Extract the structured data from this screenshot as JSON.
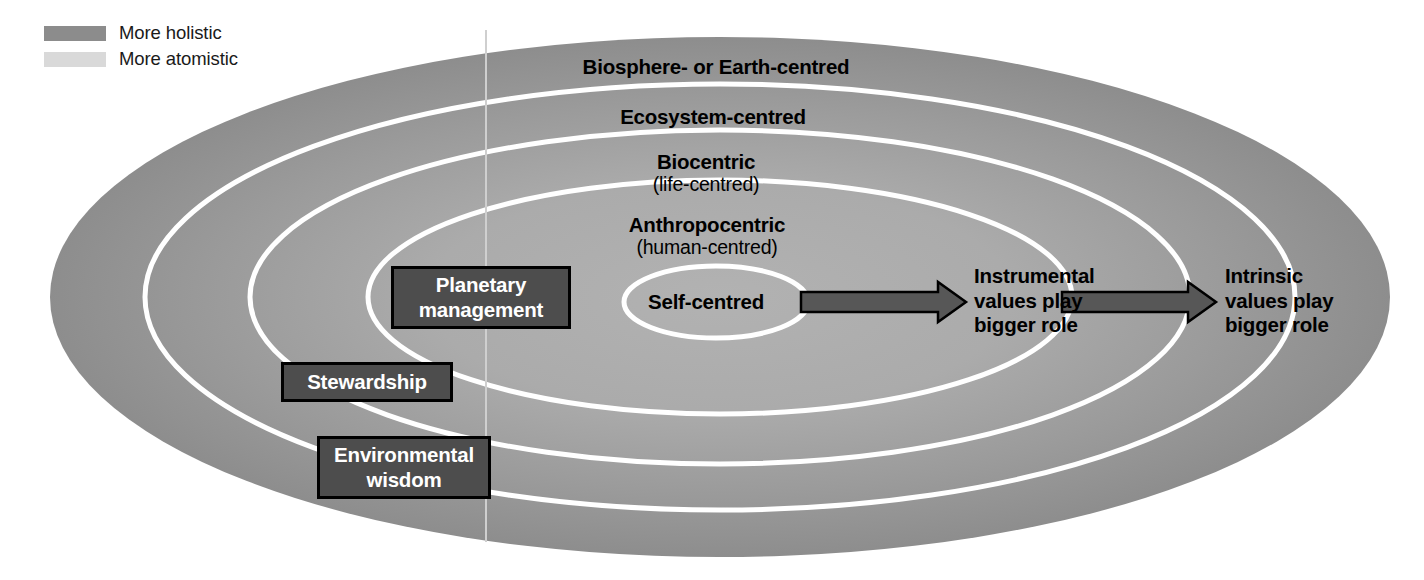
{
  "legend": {
    "items": [
      {
        "label": "More holistic",
        "swatch_color": "#8c8c8c",
        "icon": "legend-swatch-holistic"
      },
      {
        "label": "More atomistic",
        "swatch_color": "#d9d9d9",
        "icon": "legend-swatch-atomistic"
      }
    ]
  },
  "rings": [
    {
      "id": "biosphere",
      "main": "Biosphere- or Earth-centred",
      "sub": ""
    },
    {
      "id": "ecosystem",
      "main": "Ecosystem-centred",
      "sub": ""
    },
    {
      "id": "biocentric",
      "main": "Biocentric",
      "sub": "(life-centred)"
    },
    {
      "id": "anthropocentric",
      "main": "Anthropocentric",
      "sub": "(human-centred)"
    },
    {
      "id": "self",
      "main": "Self-centred",
      "sub": ""
    }
  ],
  "boxes": [
    {
      "id": "planetary",
      "line1": "Planetary",
      "line2": "management"
    },
    {
      "id": "stewardship",
      "line1": "Stewardship",
      "line2": ""
    },
    {
      "id": "environmental",
      "line1": "Environmental",
      "line2": "wisdom"
    }
  ],
  "arrow_labels": [
    {
      "id": "instrumental",
      "line1": "Instrumental",
      "line2": "values play",
      "line3": "bigger role"
    },
    {
      "id": "intrinsic",
      "line1": "Intrinsic",
      "line2": "values play",
      "line3": "bigger role"
    }
  ],
  "colors": {
    "ring_outer": "#8e8e8e",
    "ring_inner": "#adadad",
    "ring_separator": "#ffffff",
    "box_fill": "#4d4d4d",
    "box_border": "#000000",
    "box_text": "#ffffff",
    "arrow_fill": "#575757",
    "arrow_stroke": "#000000",
    "text": "#000000",
    "background": "#ffffff",
    "divider": "#cfcfcf"
  }
}
